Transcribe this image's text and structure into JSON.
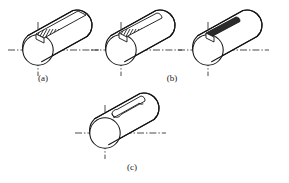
{
  "figure": {
    "background_color": "#ffffff",
    "line_color": "#141414",
    "centerline_color": "#2a2a2a",
    "hatch_fill_color": "#2b2b2b",
    "caption_color": "#1a1a1a",
    "width": 289,
    "height": 183
  },
  "captions": {
    "a": "(a)",
    "b": "(b)",
    "c": "(c)"
  },
  "panels": [
    {
      "id": "panel-a",
      "caption": "(a)",
      "keyway_style": "hatched-open-end",
      "keyway_description": "Hatched sled-runner keyway running out to the far end of the shaft",
      "caption_x": 43,
      "caption_y": 79
    },
    {
      "id": "panel-b-left",
      "caption": "(b)",
      "keyway_style": "hatched-rounded-end",
      "keyway_description": "Hatched keyway with a rounded closed end before the shaft end",
      "caption_x": 172,
      "caption_y": 79
    },
    {
      "id": "panel-b-right",
      "caption": "",
      "keyway_style": "solid-short",
      "keyway_description": "Short solid-filled keyway near the shaft end",
      "caption_x": 0,
      "caption_y": 0
    },
    {
      "id": "panel-c",
      "caption": "(c)",
      "keyway_style": "outline-rounded",
      "keyway_description": "Unfilled outlined keyway with rounded ends",
      "caption_x": 132,
      "caption_y": 168
    }
  ]
}
